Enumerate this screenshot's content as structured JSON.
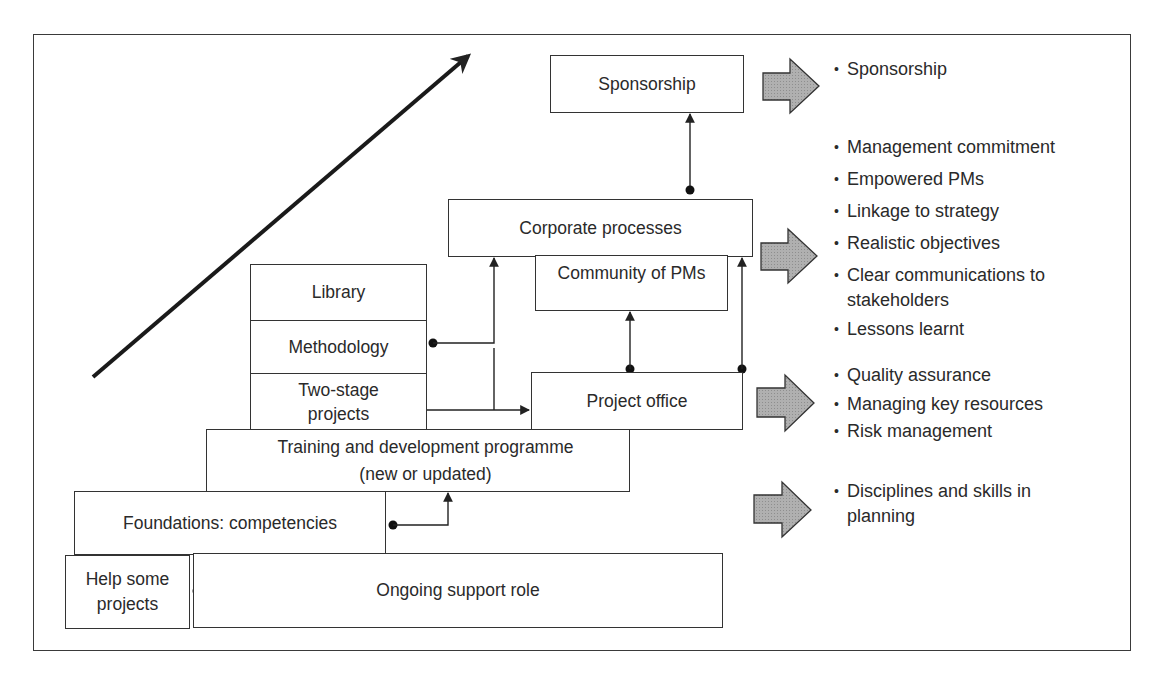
{
  "diagram": {
    "boxes": {
      "sponsorship": "Sponsorship",
      "corporate_processes": "Corporate processes",
      "community_of_pms": "Community of PMs",
      "library": "Library",
      "methodology": "Methodology",
      "two_stage_projects_line1": "Two-stage",
      "two_stage_projects_line2": "projects",
      "project_office": "Project office",
      "training_line1": "Training and development programme",
      "training_line2": "(new or updated)",
      "foundations": "Foundations: competencies",
      "help_line1": "Help some",
      "help_line2": "projects",
      "ongoing_support": "Ongoing support role"
    },
    "outcomes": [
      {
        "arrow": "block-arrow-right",
        "items": [
          "Sponsorship"
        ]
      },
      {
        "arrow": "block-arrow-right",
        "items": [
          "Management commitment",
          "Empowered PMs",
          "Linkage to strategy",
          "Realistic objectives",
          "Clear communications to",
          "stakeholders",
          "Lessons learnt"
        ]
      },
      {
        "arrow": "block-arrow-right",
        "items": [
          "Quality assurance",
          "Managing key resources",
          "Risk management"
        ]
      },
      {
        "arrow": "block-arrow-right",
        "items": [
          "Disciplines and skills in",
          "planning"
        ]
      }
    ],
    "colors": {
      "line": "#222222",
      "arrow_fill": "#a8a8a8",
      "arrow_stroke": "#333333",
      "text": "#2a2a2a"
    }
  }
}
